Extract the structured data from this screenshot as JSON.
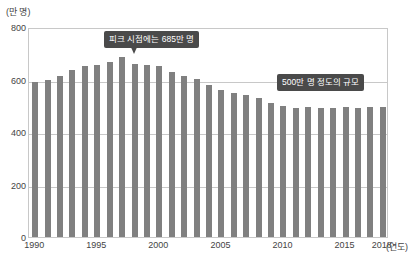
{
  "chart_data": {
    "type": "bar",
    "title": "",
    "subtitle": "",
    "xlabel": "(연도)",
    "ylabel": "(만 명)",
    "ylim": [
      0,
      800
    ],
    "xlim": [
      1990,
      2018
    ],
    "grid": true,
    "legend": null,
    "bar_color": "#808080",
    "frame_color": "#c8c8c8",
    "yticks": [
      0,
      200,
      400,
      600,
      800
    ],
    "ytick_labels": [
      "0",
      "200",
      "400",
      "600",
      "800"
    ],
    "xticks": [
      1990,
      1995,
      2000,
      2005,
      2010,
      2015,
      2018
    ],
    "xtick_labels": [
      "1990",
      "1995",
      "2000",
      "2005",
      "2010",
      "2015",
      "2018"
    ],
    "categories": [
      "1990",
      "1991",
      "1992",
      "1993",
      "1994",
      "1995",
      "1996",
      "1997",
      "1998",
      "1999",
      "2000",
      "2001",
      "2002",
      "2003",
      "2004",
      "2005",
      "2006",
      "2007",
      "2008",
      "2009",
      "2010",
      "2011",
      "2012",
      "2013",
      "2014",
      "2015",
      "2016",
      "2017",
      "2018"
    ],
    "values": [
      590,
      600,
      615,
      635,
      650,
      657,
      665,
      685,
      660,
      655,
      650,
      628,
      615,
      602,
      578,
      560,
      548,
      540,
      528,
      512,
      500,
      492,
      497,
      493,
      490,
      496,
      492,
      495,
      497
    ],
    "annotations": [
      {
        "id": "peak-callout",
        "text": "피크 시점에는 685만 명",
        "target_category": "1997",
        "target_value": 685
      },
      {
        "id": "plateau-callout",
        "text": "500만 명 정도의 규모",
        "target_category": "2013",
        "target_value": 500
      }
    ]
  }
}
